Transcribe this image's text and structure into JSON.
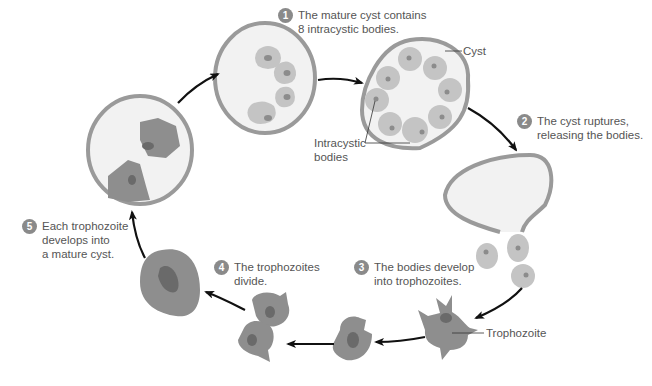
{
  "colors": {
    "cyst_wall": "#9a9a9a",
    "cyst_fill": "#f2f2f2",
    "body_fill": "#c4c4c4",
    "body_nucleus": "#8c8c8c",
    "troph_fill": "#8e8e8e",
    "troph_nucleus": "#6a6a6a",
    "arrow": "#111111",
    "badge": "#8a8a8a",
    "text": "#555555"
  },
  "steps": [
    {
      "number": "1",
      "text": "The mature cyst contains\n8 intracystic bodies."
    },
    {
      "number": "2",
      "text": "The cyst ruptures,\nreleasing the bodies."
    },
    {
      "number": "3",
      "text": "The bodies develop\ninto trophozoites."
    },
    {
      "number": "4",
      "text": "The trophozoites\ndivide."
    },
    {
      "number": "5",
      "text": "Each trophozoite\ndevelops into\na mature cyst."
    }
  ],
  "labels": {
    "cyst": "Cyst",
    "intracystic_bodies": "Intracystic\nbodies",
    "trophozoite": "Trophozoite"
  }
}
